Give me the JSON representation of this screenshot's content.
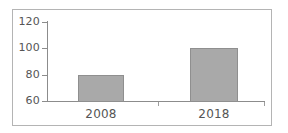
{
  "chart_data": {
    "type": "bar",
    "title": "",
    "subtitle": "",
    "xlabel": "",
    "ylabel": "",
    "categories": [
      "2008",
      "2018"
    ],
    "values": [
      80,
      100
    ],
    "series": [
      {
        "name": "",
        "values": [
          80,
          100
        ]
      }
    ],
    "ylim": [
      60,
      120
    ],
    "yticks": [
      60,
      80,
      100,
      120
    ],
    "ytick_labels": [
      "60",
      "80",
      "100",
      "120"
    ],
    "grid": false,
    "legend": false,
    "legend_position": "none",
    "annotations": [],
    "colors": {
      "bar_fill": "#a9a9a9",
      "bar_border": "#8f8f8f",
      "axis": "#8c8c8c",
      "tick_label": "#555555",
      "frame": "#b4b4b4",
      "background": "#ffffff"
    }
  }
}
